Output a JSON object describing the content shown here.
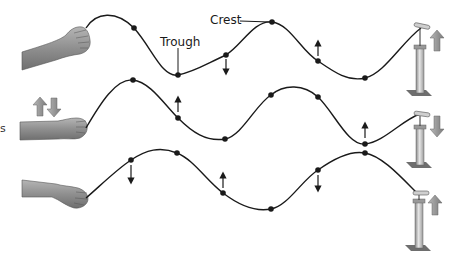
{
  "diagram": {
    "type": "transverse-wave-illustration",
    "labels": {
      "crest": "Crest",
      "trough": "Trough",
      "edge_fragment": "s"
    },
    "colors": {
      "line": "#1a1a1a",
      "dot": "#1a1a1a",
      "hand_skin": "#8a8a8a",
      "pump_body": "#c8c8c8",
      "big_arrow": "#9a9a9a"
    },
    "rows": [
      {
        "name": "row-1",
        "hand_arrows": "none",
        "pump_arrow": "up",
        "points": [
          {
            "x": 134,
            "y": 28,
            "arrow": "none"
          },
          {
            "x": 178,
            "y": 75,
            "arrow": "none",
            "label": "trough"
          },
          {
            "x": 226,
            "y": 55,
            "arrow": "down"
          },
          {
            "x": 272,
            "y": 22,
            "arrow": "none",
            "label": "crest"
          },
          {
            "x": 318,
            "y": 61,
            "arrow": "up"
          },
          {
            "x": 365,
            "y": 78,
            "arrow": "none"
          }
        ]
      },
      {
        "name": "row-2",
        "hand_arrows": "up-down",
        "pump_arrow": "down",
        "points": [
          {
            "x": 133,
            "y": 80,
            "arrow": "none"
          },
          {
            "x": 178,
            "y": 118,
            "arrow": "up"
          },
          {
            "x": 225,
            "y": 139,
            "arrow": "none"
          },
          {
            "x": 271,
            "y": 95,
            "arrow": "none"
          },
          {
            "x": 318,
            "y": 97,
            "arrow": "none"
          },
          {
            "x": 365,
            "y": 144,
            "arrow": "up"
          }
        ]
      },
      {
        "name": "row-3",
        "hand_arrows": "none",
        "pump_arrow": "up",
        "points": [
          {
            "x": 131,
            "y": 160,
            "arrow": "down"
          },
          {
            "x": 177,
            "y": 153,
            "arrow": "none"
          },
          {
            "x": 223,
            "y": 193,
            "arrow": "up"
          },
          {
            "x": 271,
            "y": 209,
            "arrow": "none"
          },
          {
            "x": 318,
            "y": 170,
            "arrow": "down"
          },
          {
            "x": 365,
            "y": 153,
            "arrow": "none"
          }
        ]
      }
    ]
  }
}
